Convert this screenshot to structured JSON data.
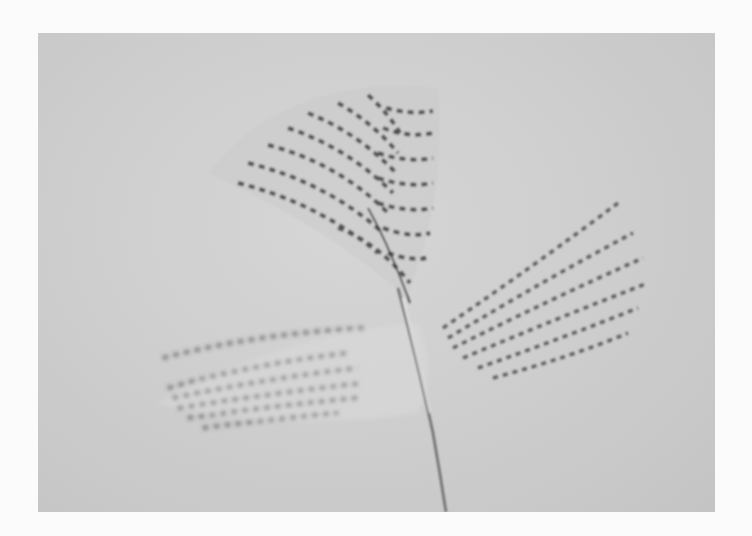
{
  "image": {
    "subject": "barred feathers on grey background",
    "style": "black and white photograph",
    "colors": {
      "background": "#cdcdcd",
      "page": "#fbfbfb",
      "barring": "#3a3a3a",
      "shaft": "#6a6a6a"
    }
  }
}
